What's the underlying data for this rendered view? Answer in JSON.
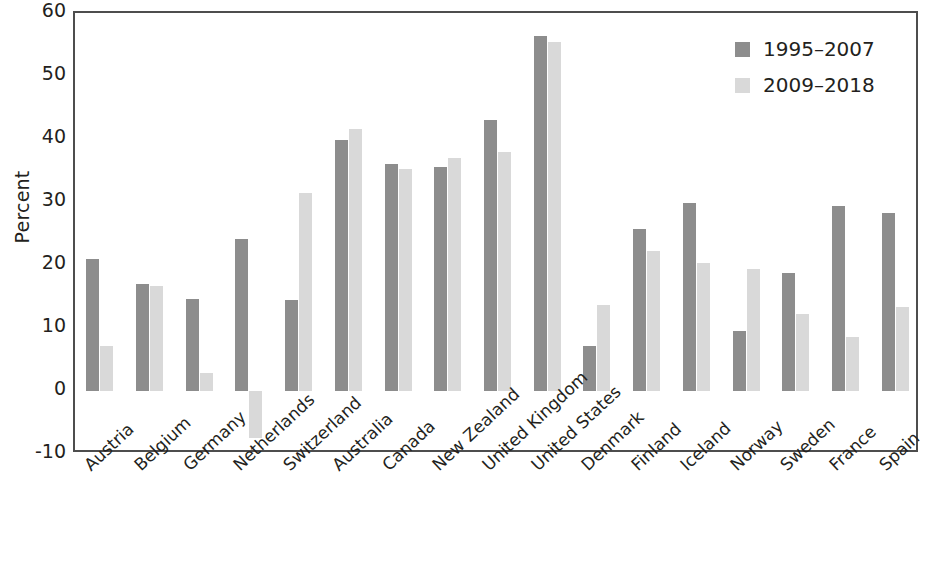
{
  "chart_data": {
    "type": "bar",
    "title": "",
    "xlabel": "",
    "ylabel": "Percent",
    "ylim": [
      -10,
      60
    ],
    "yticks": [
      -10,
      0,
      10,
      20,
      30,
      40,
      50,
      60
    ],
    "grid": false,
    "legend_position": "top-right",
    "categories": [
      "Austria",
      "Belgium",
      "Germany",
      "Netherlands",
      "Switzerland",
      "Australia",
      "Canada",
      "New Zealand",
      "United Kingdom",
      "United States",
      "Denmark",
      "Finland",
      "Iceland",
      "Norway",
      "Sweden",
      "France",
      "Spain"
    ],
    "series": [
      {
        "name": "1995–2007",
        "color": "#8d8d8d",
        "values": [
          21.0,
          17.0,
          14.6,
          24.1,
          14.4,
          39.8,
          36.1,
          35.6,
          43.0,
          56.4,
          7.2,
          25.7,
          29.9,
          9.5,
          18.8,
          29.4,
          28.3
        ]
      },
      {
        "name": "2009–2018",
        "color": "#d9d9d9",
        "values": [
          7.1,
          16.6,
          2.8,
          -7.4,
          31.5,
          41.6,
          35.2,
          37.0,
          37.9,
          55.4,
          13.6,
          22.2,
          20.3,
          19.4,
          12.2,
          8.5,
          13.3
        ]
      }
    ]
  },
  "legend": {
    "items": [
      {
        "label": "1995–2007",
        "series": 0
      },
      {
        "label": "2009–2018",
        "series": 1
      }
    ]
  },
  "axes": {
    "y_title": "Percent"
  }
}
